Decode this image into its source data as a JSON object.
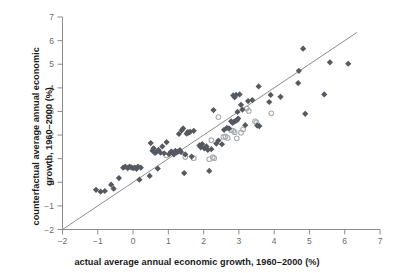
{
  "chart_data": {
    "type": "scatter",
    "title": "",
    "xlabel": "actual average annual economic growth, 1960–2000 (%)",
    "ylabel_line1": "counterfactual average annual economic",
    "ylabel_line2": "growth, 1960–2000 (%)",
    "ylabel": "counterfactual average annual economic growth, 1960–2000 (%)",
    "xlim": [
      -2,
      7
    ],
    "ylim": [
      -2,
      7
    ],
    "xticks": [
      -2,
      -1,
      0,
      1,
      2,
      3,
      4,
      5,
      6,
      7
    ],
    "xticklabels": [
      "−2",
      "−1",
      "0",
      "1",
      "2",
      "3",
      "4",
      "5",
      "6",
      "7"
    ],
    "yticks": [
      -2,
      -1,
      0,
      1,
      2,
      3,
      4,
      5,
      6,
      7
    ],
    "yticklabels": [
      "−2",
      "−1",
      "0",
      "1",
      "2",
      "3",
      "4",
      "5",
      "6",
      "7"
    ],
    "grid": false,
    "legend": "none",
    "axis_color": "#8c8c8c",
    "label_color": "#6b6b6b",
    "title_color": "#1a1a1a",
    "reference_line": {
      "name": "45-degree identity line",
      "x0": -2,
      "y0": -2,
      "x1": 6.35,
      "y1": 6.35,
      "color": "#6e6e6e",
      "width": 0.8
    },
    "series": [
      {
        "name": "filled",
        "marker": "diamond",
        "color": "#555a60",
        "size": 3.1,
        "points": [
          [
            -1.05,
            -0.32
          ],
          [
            -0.92,
            -0.4
          ],
          [
            -0.8,
            -0.37
          ],
          [
            -0.62,
            -0.1
          ],
          [
            -0.55,
            -0.27
          ],
          [
            -0.4,
            0.18
          ],
          [
            -0.28,
            0.62
          ],
          [
            -0.22,
            0.66
          ],
          [
            -0.15,
            0.6
          ],
          [
            -0.1,
            0.66
          ],
          [
            -0.05,
            0.63
          ],
          [
            0.0,
            0.6
          ],
          [
            0.05,
            0.62
          ],
          [
            0.1,
            0.57
          ],
          [
            0.14,
            0.66
          ],
          [
            0.18,
            0.11
          ],
          [
            0.22,
            0.62
          ],
          [
            0.47,
            0.27
          ],
          [
            0.5,
            1.66
          ],
          [
            0.55,
            1.34
          ],
          [
            0.58,
            1.44
          ],
          [
            0.62,
            1.24
          ],
          [
            0.66,
            1.29
          ],
          [
            0.7,
            0.58
          ],
          [
            0.72,
            1.37
          ],
          [
            0.78,
            1.25
          ],
          [
            0.83,
            1.52
          ],
          [
            0.88,
            1.23
          ],
          [
            0.95,
            1.7
          ],
          [
            1.02,
            1.19
          ],
          [
            1.08,
            1.3
          ],
          [
            1.12,
            1.27
          ],
          [
            1.16,
            1.18
          ],
          [
            1.2,
            1.33
          ],
          [
            1.24,
            1.27
          ],
          [
            1.28,
            1.31
          ],
          [
            1.3,
            2.05
          ],
          [
            1.33,
            1.36
          ],
          [
            1.36,
            1.28
          ],
          [
            1.38,
            2.2
          ],
          [
            1.42,
            2.28
          ],
          [
            1.45,
            0.39
          ],
          [
            1.48,
            1.18
          ],
          [
            1.52,
            2.06
          ],
          [
            1.55,
            2.12
          ],
          [
            1.58,
            2.1
          ],
          [
            1.62,
            2.14
          ],
          [
            1.66,
            1.09
          ],
          [
            1.72,
            2.18
          ],
          [
            1.88,
            1.56
          ],
          [
            1.92,
            1.48
          ],
          [
            1.96,
            1.62
          ],
          [
            2.02,
            1.44
          ],
          [
            2.08,
            1.52
          ],
          [
            2.12,
            1.37
          ],
          [
            2.16,
            0.48
          ],
          [
            2.22,
            1.4
          ],
          [
            2.28,
            3.06
          ],
          [
            2.36,
            1.64
          ],
          [
            2.42,
            1.77
          ],
          [
            2.52,
            1.61
          ],
          [
            2.58,
            2.22
          ],
          [
            2.66,
            2.3
          ],
          [
            2.72,
            2.28
          ],
          [
            2.78,
            2.58
          ],
          [
            2.82,
            2.52
          ],
          [
            2.84,
            3.68
          ],
          [
            2.86,
            2.56
          ],
          [
            2.88,
            3.6
          ],
          [
            2.9,
            2.6
          ],
          [
            2.92,
            3.7
          ],
          [
            2.94,
            2.62
          ],
          [
            2.96,
            2.98
          ],
          [
            2.98,
            2.7
          ],
          [
            3.02,
            3.72
          ],
          [
            3.06,
            3.28
          ],
          [
            3.1,
            3.08
          ],
          [
            3.18,
            2.42
          ],
          [
            3.26,
            3.44
          ],
          [
            3.38,
            3.48
          ],
          [
            3.52,
            2.4
          ],
          [
            3.56,
            4.06
          ],
          [
            3.58,
            2.38
          ],
          [
            3.86,
            3.4
          ],
          [
            3.9,
            3.7
          ],
          [
            4.18,
            3.62
          ],
          [
            4.68,
            4.2
          ],
          [
            4.7,
            4.72
          ],
          [
            4.82,
            5.66
          ],
          [
            4.88,
            2.9
          ],
          [
            5.42,
            3.72
          ],
          [
            5.58,
            5.08
          ],
          [
            6.1,
            5.02
          ]
        ]
      },
      {
        "name": "open",
        "marker": "circle-open",
        "color": "#a9adb2",
        "size": 3.0,
        "points": [
          [
            0.94,
            1.14
          ],
          [
            1.48,
            1.07
          ],
          [
            1.72,
            1.02
          ],
          [
            2.22,
            1.78
          ],
          [
            2.26,
            1.06
          ],
          [
            2.3,
            1.02
          ],
          [
            2.42,
            2.76
          ],
          [
            2.56,
            1.92
          ],
          [
            2.62,
            1.94
          ],
          [
            2.68,
            1.88
          ],
          [
            2.78,
            2.2
          ],
          [
            2.84,
            2.18
          ],
          [
            2.88,
            2.12
          ],
          [
            2.94,
            1.86
          ],
          [
            3.06,
            2.1
          ],
          [
            3.12,
            2.24
          ],
          [
            3.22,
            3.12
          ],
          [
            3.28,
            3.02
          ],
          [
            3.46,
            2.58
          ],
          [
            3.5,
            2.54
          ],
          [
            3.92,
            2.92
          ],
          [
            2.16,
            0.98
          ]
        ]
      }
    ]
  }
}
